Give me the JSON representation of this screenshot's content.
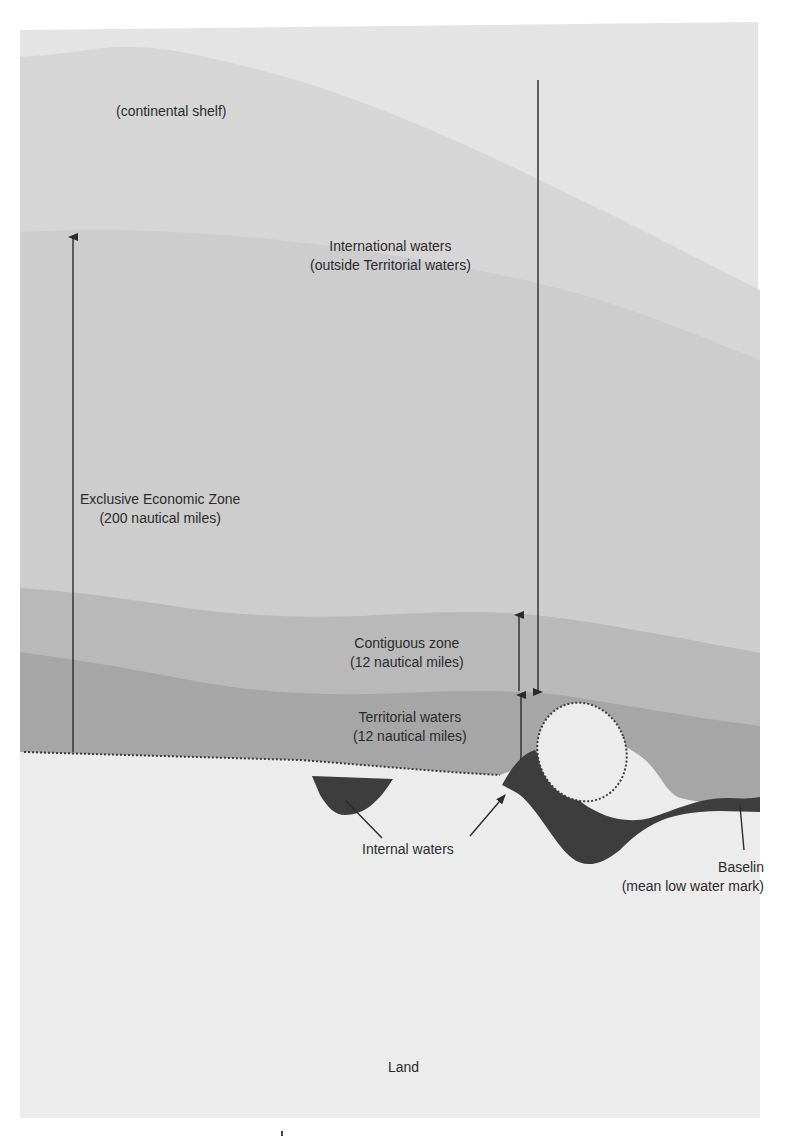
{
  "diagram": {
    "colors": {
      "page": "#ffffff",
      "high_seas": "#e4e4e4",
      "continental_shelf": "#d6d6d6",
      "eez": "#cdcdcd",
      "contiguous_zone": "#b9b9b9",
      "territorial_waters": "#a6a6a6",
      "internal_waters": "#3d3d3d",
      "land": "#ececec",
      "ink": "#2b2b2b"
    },
    "labels": {
      "continental_shelf": "(continental shelf)",
      "international_waters": {
        "line1": "International waters",
        "line2": "(outside Territorial waters)"
      },
      "eez": {
        "line1": "Exclusive Economic Zone",
        "line2": "(200 nautical miles)"
      },
      "contiguous_zone": {
        "line1": "Contiguous zone",
        "line2": "(12 nautical miles)"
      },
      "territorial_waters": {
        "line1": "Territorial waters",
        "line2": "(12 nautical miles)"
      },
      "internal_waters": "Internal waters",
      "baseline": {
        "line1": "Baselin",
        "line2": "(mean low water mark)"
      },
      "land": "Land"
    },
    "arrows": [
      {
        "name": "eez-extent-arrow",
        "direction": "up"
      },
      {
        "name": "international-waters-arrow",
        "direction": "down"
      },
      {
        "name": "contiguous-zone-arrow",
        "direction": "up"
      },
      {
        "name": "territorial-waters-arrow",
        "direction": "up"
      },
      {
        "name": "internal-waters-left-pointer",
        "direction": "up-left"
      },
      {
        "name": "internal-waters-right-pointer",
        "direction": "up-right"
      },
      {
        "name": "baseline-pointer",
        "direction": "up"
      }
    ]
  }
}
